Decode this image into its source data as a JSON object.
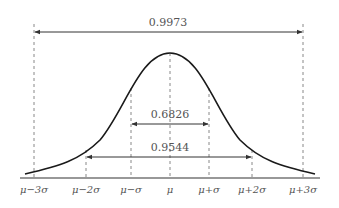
{
  "diagram": {
    "colors": {
      "curve": "#1a1a1a",
      "axis": "#333333",
      "dashed": "#888888",
      "arrow": "#333333",
      "text": "#555555"
    },
    "intervals": [
      {
        "label": "0.9973",
        "from": "μ-3σ",
        "to": "μ+3σ"
      },
      {
        "label": "0.6826",
        "from": "μ-σ",
        "to": "μ+σ"
      },
      {
        "label": "0.9544",
        "from": "μ-2σ",
        "to": "μ+2σ"
      }
    ],
    "ticks": [
      {
        "label": "μ−3σ"
      },
      {
        "label": "μ−2σ"
      },
      {
        "label": "μ−σ"
      },
      {
        "label": "μ"
      },
      {
        "label": "μ+σ"
      },
      {
        "label": "μ+2σ"
      },
      {
        "label": "μ+3σ"
      }
    ]
  }
}
